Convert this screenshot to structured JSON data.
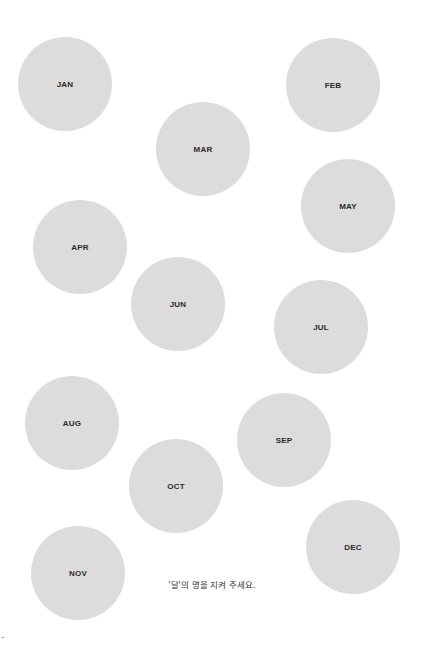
{
  "months": [
    {
      "label": "JAN",
      "cx": 65,
      "cy": 84
    },
    {
      "label": "FEB",
      "cx": 333,
      "cy": 85
    },
    {
      "label": "MAR",
      "cx": 203,
      "cy": 149
    },
    {
      "label": "APR",
      "cx": 80,
      "cy": 247
    },
    {
      "label": "MAY",
      "cx": 348,
      "cy": 206
    },
    {
      "label": "JUN",
      "cx": 178,
      "cy": 304
    },
    {
      "label": "JUL",
      "cx": 321,
      "cy": 327
    },
    {
      "label": "AUG",
      "cx": 72,
      "cy": 423
    },
    {
      "label": "SEP",
      "cx": 284,
      "cy": 440
    },
    {
      "label": "OCT",
      "cx": 176,
      "cy": 486
    },
    {
      "label": "NOV",
      "cx": 78,
      "cy": 573
    },
    {
      "label": "DEC",
      "cx": 353,
      "cy": 547
    }
  ],
  "circle": {
    "radius": 47,
    "fill": "#dcdcdc",
    "text_color": "#2a2a2a"
  },
  "caption": "'달'의 명을 지켜 주세요."
}
